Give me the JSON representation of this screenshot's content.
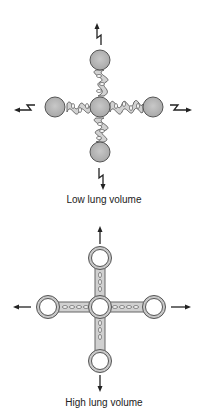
{
  "panels": [
    {
      "id": "low",
      "label": "Low lung volume",
      "description": "Alveoli with collapsed, wavy connecting interstitium; zig-zag arrows indicate low tethering traction",
      "arrow_style": "zigzag",
      "alveolus_style": "filled"
    },
    {
      "id": "high",
      "label": "High lung volume",
      "description": "Expanded, open alveoli with straight stretched interstitium; straight arrows indicate strong radial traction",
      "arrow_style": "straight",
      "alveolus_style": "ring"
    }
  ],
  "colors": {
    "ball_fill": "#b8b8b8",
    "ball_stroke": "#555555",
    "tissue_fill": "#d0d0d0",
    "tissue_stroke": "#666666",
    "arrow": "#222222",
    "text": "#222222"
  }
}
